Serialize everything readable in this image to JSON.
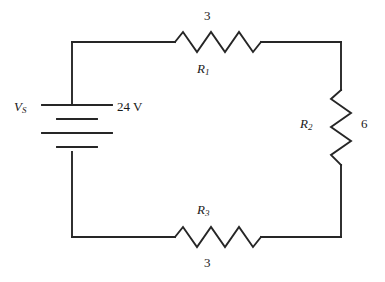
{
  "figure": {
    "type": "circuit-schematic",
    "stroke_color": "#262626",
    "background_color": "#ffffff"
  },
  "source": {
    "name": "voltage-source",
    "symbol": "battery",
    "reference_letter": "V",
    "reference_subscript": "S",
    "value": "24 V"
  },
  "components": [
    {
      "name": "resistor-r1",
      "reference_letter": "R",
      "reference_subscript": "1",
      "value": "3",
      "orientation": "horizontal",
      "position": "top"
    },
    {
      "name": "resistor-r2",
      "reference_letter": "R",
      "reference_subscript": "2",
      "value": "6",
      "orientation": "vertical",
      "position": "right"
    },
    {
      "name": "resistor-r3",
      "reference_letter": "R",
      "reference_subscript": "3",
      "value": "3",
      "orientation": "horizontal",
      "position": "bottom"
    }
  ]
}
